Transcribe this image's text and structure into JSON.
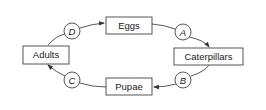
{
  "diagram": {
    "type": "cycle",
    "stages": [
      {
        "id": "eggs",
        "label": "Eggs"
      },
      {
        "id": "caterpillars",
        "label": "Caterpillars"
      },
      {
        "id": "pupae",
        "label": "Pupae"
      },
      {
        "id": "adults",
        "label": "Adults"
      }
    ],
    "transitions": [
      {
        "label": "A",
        "from": "Eggs",
        "to": "Caterpillars"
      },
      {
        "label": "B",
        "from": "Caterpillars",
        "to": "Pupae"
      },
      {
        "label": "C",
        "from": "Pupae",
        "to": "Adults"
      },
      {
        "label": "D",
        "from": "Adults",
        "to": "Eggs"
      }
    ],
    "colors": {
      "line": "#333333",
      "background": "#ffffff"
    }
  }
}
